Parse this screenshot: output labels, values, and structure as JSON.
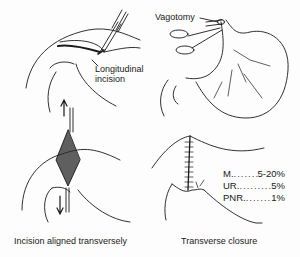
{
  "figure": {
    "panels": [
      {
        "id": "top-left",
        "description": "Duodenum with forceps at longitudinal incision"
      },
      {
        "id": "top-right",
        "description": "Stomach with vagotomy clamp"
      },
      {
        "id": "bottom-left",
        "description": "Incision opened with arrows, aligned transversely"
      },
      {
        "id": "bottom-right",
        "description": "Transverse closure with sutures"
      }
    ],
    "labels": {
      "longitudinal": "Longitudinal",
      "incision": "incision",
      "vagotomy": "Vagotomy"
    },
    "captions": {
      "bottom_left": "Incision aligned transversely",
      "bottom_right": "Transverse closure"
    },
    "stats": [
      {
        "name": "M.",
        "value": "5-20%"
      },
      {
        "name": "UR.",
        "value": "5%"
      },
      {
        "name": "PNR.",
        "value": "1%"
      }
    ]
  }
}
